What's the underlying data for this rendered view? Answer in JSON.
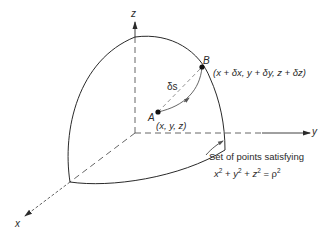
{
  "figure": {
    "type": "3d-sphere-octant",
    "axes": {
      "x": {
        "label": "x"
      },
      "y": {
        "label": "y"
      },
      "z": {
        "label": "z"
      }
    },
    "points": {
      "A": {
        "label": "A",
        "coords": "(x, y, z)"
      },
      "B": {
        "label": "B",
        "coords": "(x + δx, y + δy, z + δz)"
      }
    },
    "arc_label": "δs",
    "annotation": {
      "line1": "Set of points satisfying",
      "equation": {
        "t1": "x",
        "e1": "2",
        "p1": " + ",
        "t2": "y",
        "e2": "2",
        "p2": " + ",
        "t3": "z",
        "e3": "2",
        "eq": " = ",
        "t4": "ρ",
        "e4": "2"
      }
    },
    "colors": {
      "stroke": "#2a2a2a",
      "dash": "#555555",
      "background": "#ffffff"
    }
  }
}
